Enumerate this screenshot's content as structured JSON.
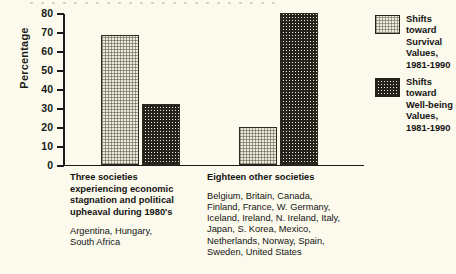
{
  "chart_data": {
    "type": "bar",
    "title": "",
    "xlabel": "",
    "ylabel": "Percentage",
    "ylim": [
      0,
      80
    ],
    "yticks": [
      0,
      10,
      20,
      30,
      40,
      50,
      60,
      70,
      80
    ],
    "ytick_labels": [
      "0",
      "10",
      "20",
      "30",
      "40",
      "50",
      "60",
      "70",
      "80"
    ],
    "grid": false,
    "legend_position": "right",
    "categories": [
      "Three societies experiencing economic stagnation and political upheaval during 1980's",
      "Eighteen other societies"
    ],
    "series": [
      {
        "name": "Shifts toward Survival Values, 1981-1990",
        "values": [
          68,
          20
        ]
      },
      {
        "name": "Shifts toward Well-being Values, 1981-1990",
        "values": [
          32,
          80
        ]
      }
    ]
  },
  "axis": {
    "y_label": "Percentage",
    "ticks": [
      "80",
      "70",
      "60",
      "50",
      "40",
      "30",
      "20",
      "10",
      "0"
    ]
  },
  "legend": {
    "items": [
      {
        "label": "Shifts toward\nSurvival Values,\n1981-1990",
        "swatch": "light-dotted-swatch"
      },
      {
        "label": "Shifts toward\nWell-being Values,\n1981-1990",
        "swatch": "dark-checkered-swatch"
      }
    ]
  },
  "groups": [
    {
      "title": "Three societies\nexperiencing economic\nstagnation and political\nupheaval during 1980's",
      "members": "Argentina, Hungary,\nSouth Africa"
    },
    {
      "title": "Eighteen other societies",
      "members": "Belgium, Britain, Canada,\nFinland, France, W. Germany,\nIceland, Ireland, N. Ireland, Italy,\nJapan, S. Korea, Mexico,\nNetherlands, Norway, Spain,\nSweden, United States"
    }
  ]
}
